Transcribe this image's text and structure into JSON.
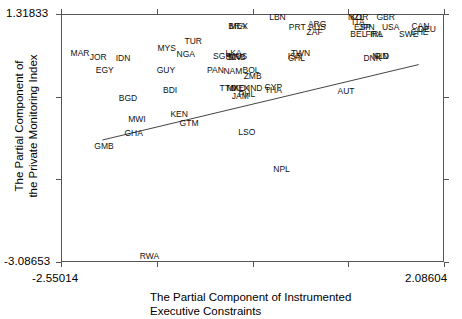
{
  "chart_data": {
    "type": "scatter",
    "title": "",
    "xlabel": "The Partial Component of Instrumented\nExecutive Constraints",
    "ylabel": "The Partial Component of\nthe Private Monitoring Index",
    "xlim": [
      -2.55014,
      2.08604
    ],
    "ylim": [
      -3.08653,
      1.31833
    ],
    "x_tick_labels": [
      "-2.55014",
      "2.08604"
    ],
    "y_tick_labels": [
      "1.31833",
      "-3.08653"
    ],
    "grid": false,
    "legend": "none",
    "n_x_ticks": 5,
    "n_y_ticks": 4,
    "fit_line": {
      "type": "linear",
      "x_start": -2.05,
      "y_start": -0.92,
      "x_end": 1.78,
      "y_end": 0.42
    },
    "point_labels": [
      "MAR",
      "JOR",
      "IDN",
      "MYS",
      "TUR",
      "NGA",
      "SGP",
      "SLV",
      "SRB",
      "EGY",
      "GUY",
      "PAN",
      "NAM",
      "BGD",
      "BDI",
      "MWI",
      "GHA",
      "GMB",
      "KEN",
      "GTM",
      "LSO",
      "RWA",
      "NPL",
      "LBN",
      "BRA",
      "MEX",
      "PRT",
      "ARG",
      "AUS",
      "ZAF",
      "NZL",
      "KOR",
      "GBR",
      "ITA",
      "ESP",
      "JPN",
      "USA",
      "CAN",
      "DEU",
      "BEL",
      "FRA",
      "IRL",
      "SWE",
      "CHE",
      "LKA",
      "MUS",
      "ISR",
      "CHL",
      "TWN",
      "DNK",
      "NLD",
      "FIN",
      "BOL",
      "ZMB",
      "TTO",
      "MKD",
      "IND",
      "CYP",
      "THA",
      "JAM",
      "PHL",
      "AUT"
    ],
    "points": [
      {
        "label": "MAR",
        "x": -2.32,
        "y": 0.63
      },
      {
        "label": "JOR",
        "x": -2.1,
        "y": 0.55
      },
      {
        "label": "IDN",
        "x": -1.8,
        "y": 0.53
      },
      {
        "label": "MYS",
        "x": -1.27,
        "y": 0.72
      },
      {
        "label": "TUR",
        "x": -0.95,
        "y": 0.83
      },
      {
        "label": "NGA",
        "x": -1.04,
        "y": 0.6
      },
      {
        "label": "SGP",
        "x": -0.6,
        "y": 0.57
      },
      {
        "label": "SLV",
        "x": -0.46,
        "y": 0.55
      },
      {
        "label": "SRB",
        "x": -0.42,
        "y": 0.55
      },
      {
        "label": "EGY",
        "x": -2.02,
        "y": 0.33
      },
      {
        "label": "GUY",
        "x": -1.28,
        "y": 0.33
      },
      {
        "label": "PAN",
        "x": -0.68,
        "y": 0.33
      },
      {
        "label": "NAM",
        "x": -0.47,
        "y": 0.31
      },
      {
        "label": "BGD",
        "x": -1.74,
        "y": -0.17
      },
      {
        "label": "BDI",
        "x": -1.23,
        "y": -0.03
      },
      {
        "label": "MWI",
        "x": -1.63,
        "y": -0.55
      },
      {
        "label": "GHA",
        "x": -1.67,
        "y": -0.8
      },
      {
        "label": "GMB",
        "x": -2.03,
        "y": -1.03
      },
      {
        "label": "KEN",
        "x": -1.12,
        "y": -0.45
      },
      {
        "label": "GTM",
        "x": -1.0,
        "y": -0.61
      },
      {
        "label": "LSO",
        "x": -0.3,
        "y": -0.78
      },
      {
        "label": "RWA",
        "x": -1.48,
        "y": -2.98
      },
      {
        "label": "NPL",
        "x": 0.12,
        "y": -1.44
      },
      {
        "label": "LBN",
        "x": 0.07,
        "y": 1.27
      },
      {
        "label": "BRA",
        "x": -0.42,
        "y": 1.1
      },
      {
        "label": "MEX",
        "x": -0.4,
        "y": 1.1
      },
      {
        "label": "PRT",
        "x": 0.31,
        "y": 1.09
      },
      {
        "label": "ARG",
        "x": 0.55,
        "y": 1.14
      },
      {
        "label": "AUS",
        "x": 0.55,
        "y": 1.08
      },
      {
        "label": "ZAF",
        "x": 0.52,
        "y": 0.99
      },
      {
        "label": "NZL",
        "x": 1.02,
        "y": 1.26
      },
      {
        "label": "KOR",
        "x": 1.06,
        "y": 1.26
      },
      {
        "label": "GBR",
        "x": 1.38,
        "y": 1.26
      },
      {
        "label": "ITA",
        "x": 1.05,
        "y": 1.18
      },
      {
        "label": "ESP",
        "x": 1.1,
        "y": 1.08
      },
      {
        "label": "JPN",
        "x": 1.15,
        "y": 1.08
      },
      {
        "label": "USA",
        "x": 1.44,
        "y": 1.08
      },
      {
        "label": "CAN",
        "x": 1.8,
        "y": 1.11
      },
      {
        "label": "DEU",
        "x": 1.88,
        "y": 1.06
      },
      {
        "label": "BEL",
        "x": 1.05,
        "y": 0.97
      },
      {
        "label": "FRA",
        "x": 1.24,
        "y": 0.97
      },
      {
        "label": "IRL",
        "x": 1.27,
        "y": 0.97
      },
      {
        "label": "SWE",
        "x": 1.66,
        "y": 0.96
      },
      {
        "label": "CHE",
        "x": 1.79,
        "y": 0.99
      },
      {
        "label": "LKA",
        "x": -0.46,
        "y": 0.62
      },
      {
        "label": "MUS",
        "x": -0.41,
        "y": 0.58
      },
      {
        "label": "ISR",
        "x": 0.28,
        "y": 0.57
      },
      {
        "label": "CHL",
        "x": 0.3,
        "y": 0.53
      },
      {
        "label": "TWN",
        "x": 0.35,
        "y": 0.62
      },
      {
        "label": "DNK",
        "x": 1.22,
        "y": 0.53
      },
      {
        "label": "NLD",
        "x": 1.32,
        "y": 0.58
      },
      {
        "label": "FIN",
        "x": 1.33,
        "y": 0.57
      },
      {
        "label": "BOL",
        "x": -0.25,
        "y": 0.33
      },
      {
        "label": "ZMB",
        "x": -0.23,
        "y": 0.21
      },
      {
        "label": "TTO",
        "x": -0.53,
        "y": 0.0
      },
      {
        "label": "MKD",
        "x": -0.43,
        "y": 0.0
      },
      {
        "label": "MEX2",
        "x": -0.38,
        "y": 0.0
      },
      {
        "label": "IND",
        "x": -0.2,
        "y": 0.0
      },
      {
        "label": "CYP",
        "x": 0.02,
        "y": 0.03
      },
      {
        "label": "THA",
        "x": 0.02,
        "y": -0.04
      },
      {
        "label": "JAM",
        "x": -0.38,
        "y": -0.14
      },
      {
        "label": "PHL",
        "x": -0.3,
        "y": -0.11
      },
      {
        "label": "AUT",
        "x": 0.9,
        "y": -0.05
      }
    ]
  },
  "labels": {
    "y_top": "1.31833",
    "y_bottom": "-3.08653",
    "x_left": "-2.55014",
    "x_right": "2.08604",
    "x_title": "The Partial Component of Instrumented\nExecutive Constraints",
    "y_title": "The Partial Component of\nthe Private Monitoring Index"
  },
  "colors": {
    "axis": "#555555",
    "text": "#000000",
    "point": "#111111",
    "background": "#ffffff"
  }
}
